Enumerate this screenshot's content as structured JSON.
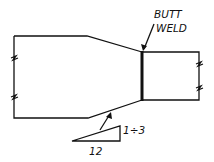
{
  "diagram": {
    "labels": {
      "weld_line1": "BUTT",
      "weld_line2": "WELD",
      "slope_rise": "1÷3",
      "slope_run": "12"
    },
    "colors": {
      "ink": "#111111",
      "background": "#ffffff"
    }
  }
}
